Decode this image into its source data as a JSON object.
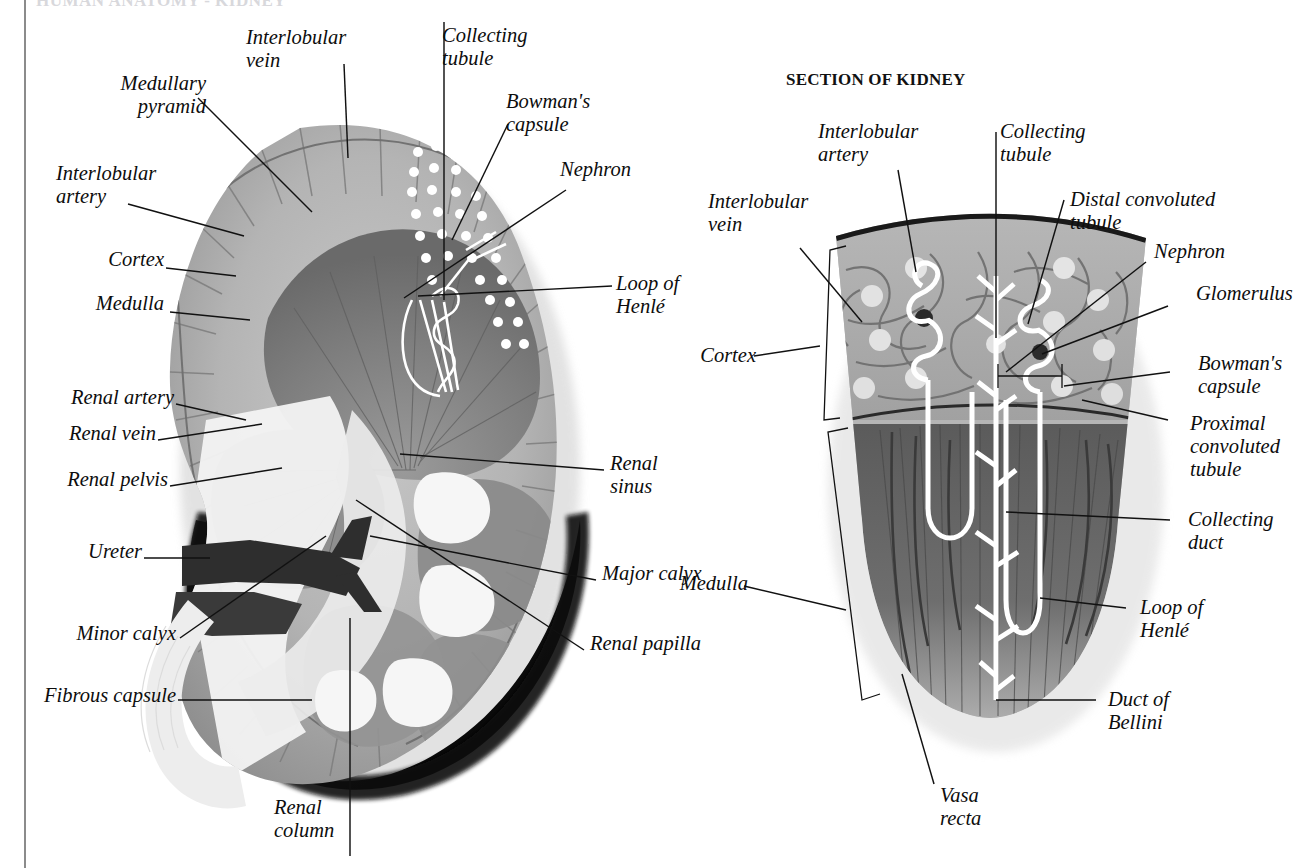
{
  "page": {
    "cut_off_title": "HUMAN ANATOMY - KIDNEY",
    "background_color": "#ffffff",
    "ink_color": "#0d0d0d"
  },
  "figures": {
    "left": {
      "name": "coronal-section-of-whole-kidney",
      "labels": [
        {
          "id": "medullary-pyramid",
          "text": "Medullary\npyramid"
        },
        {
          "id": "interlobular-vein",
          "text": "Interlobular\nvein"
        },
        {
          "id": "collecting-tubule",
          "text": "Collecting\ntubule"
        },
        {
          "id": "bowmans-capsule",
          "text": "Bowman's\ncapsule"
        },
        {
          "id": "nephron",
          "text": "Nephron"
        },
        {
          "id": "interlobular-artery",
          "text": "Interlobular\nartery"
        },
        {
          "id": "cortex",
          "text": "Cortex"
        },
        {
          "id": "medulla",
          "text": "Medulla"
        },
        {
          "id": "loop-of-henle",
          "text": "Loop of\nHenlé"
        },
        {
          "id": "renal-artery",
          "text": "Renal artery"
        },
        {
          "id": "renal-vein",
          "text": "Renal vein"
        },
        {
          "id": "renal-pelvis",
          "text": "Renal pelvis"
        },
        {
          "id": "renal-sinus",
          "text": "Renal\nsinus"
        },
        {
          "id": "ureter",
          "text": "Ureter"
        },
        {
          "id": "major-calyx",
          "text": "Major calyx"
        },
        {
          "id": "minor-calyx",
          "text": "Minor calyx"
        },
        {
          "id": "renal-papilla",
          "text": "Renal papilla"
        },
        {
          "id": "fibrous-capsule",
          "text": "Fibrous capsule"
        },
        {
          "id": "renal-column",
          "text": "Renal\ncolumn"
        }
      ]
    },
    "right": {
      "name": "section-of-kidney-wedge",
      "title": "SECTION OF KIDNEY",
      "labels": [
        {
          "id": "interlobular-artery",
          "text": "Interlobular\nartery"
        },
        {
          "id": "interlobular-vein",
          "text": "Interlobular\nvein"
        },
        {
          "id": "collecting-tubule",
          "text": "Collecting\ntubule"
        },
        {
          "id": "distal-convoluted-tubule",
          "text": "Distal convoluted\ntubule"
        },
        {
          "id": "nephron",
          "text": "Nephron"
        },
        {
          "id": "glomerulus",
          "text": "Glomerulus"
        },
        {
          "id": "bowmans-capsule",
          "text": "Bowman's\ncapsule"
        },
        {
          "id": "proximal-convoluted-tubule",
          "text": "Proximal\nconvoluted\ntubule"
        },
        {
          "id": "cortex",
          "text": "Cortex"
        },
        {
          "id": "medulla",
          "text": "Medulla"
        },
        {
          "id": "collecting-duct",
          "text": "Collecting\nduct"
        },
        {
          "id": "loop-of-henle",
          "text": "Loop of\nHenlé"
        },
        {
          "id": "duct-of-bellini",
          "text": "Duct of\nBellini"
        },
        {
          "id": "vasa-recta",
          "text": "Vasa\nrecta"
        }
      ]
    }
  }
}
